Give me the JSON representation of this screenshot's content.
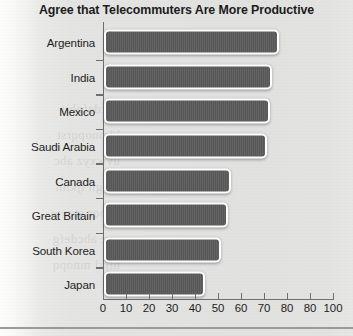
{
  "chart_data": {
    "type": "bar",
    "orientation": "horizontal",
    "title": "Agree that Telecommuters Are More Productive",
    "xlabel": "",
    "ylabel": "",
    "xlim": [
      0,
      100
    ],
    "grid": false,
    "legend": null,
    "categories": [
      "Argentina",
      "India",
      "Mexico",
      "Saudi Arabia",
      "Canada",
      "Great Britain",
      "South Korea",
      "Japan"
    ],
    "values": [
      76,
      73,
      72,
      71,
      55,
      54,
      51,
      44
    ],
    "xticks": [
      0,
      10,
      20,
      30,
      40,
      50,
      60,
      70,
      80,
      80,
      100
    ],
    "xtick_positions": [
      0,
      10,
      20,
      30,
      40,
      50,
      60,
      70,
      80,
      90,
      100
    ],
    "colors": {
      "bar_fill": "#5a5a5a",
      "bar_outline": "#ffffff",
      "axis": "#6f6f6f",
      "text": "#1d1d1d",
      "panel_background": "#e2e2e1",
      "page_background": "#fbfbfa"
    }
  },
  "bleed_text": "abcdefghij\nklmnopqrst\nuvwxyz abc\ndefgh ijklm\nnopqr stuvw\nxyz abcdefg\nhijkl mnopq"
}
